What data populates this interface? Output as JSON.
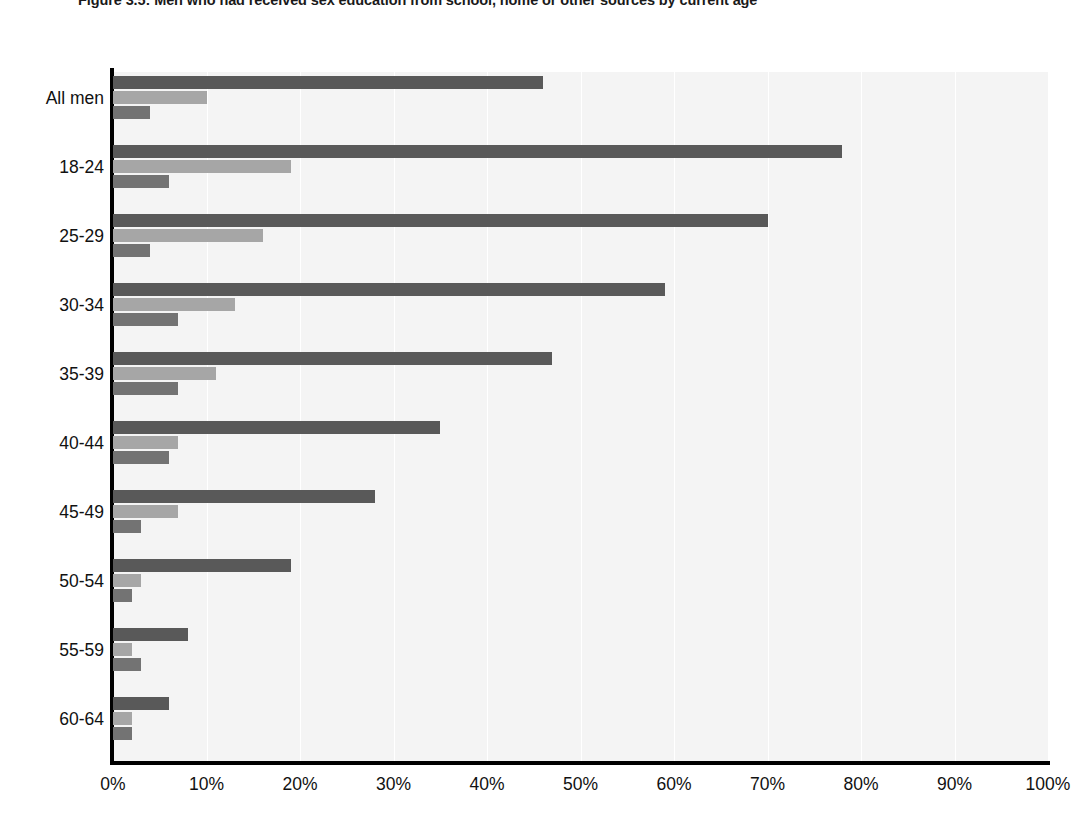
{
  "figure": {
    "title": "Figure 3.5: Men who had received sex education from school, home or other sources by current age"
  },
  "chart_data": {
    "type": "bar",
    "orientation": "horizontal",
    "title": "Figure 3.5: Men who had received sex education from school, home or other sources by current age",
    "xlabel": "",
    "ylabel": "",
    "xlim": [
      0,
      100
    ],
    "xunit": "%",
    "grid": true,
    "legend_position": "none",
    "categories": [
      "All men",
      "18-24",
      "25-29",
      "30-34",
      "35-39",
      "40-44",
      "45-49",
      "50-54",
      "55-59",
      "60-64"
    ],
    "xticks": [
      0,
      10,
      20,
      30,
      40,
      50,
      60,
      70,
      80,
      90,
      100
    ],
    "xticklabels": [
      "0%",
      "10%",
      "20%",
      "30%",
      "40%",
      "50%",
      "60%",
      "70%",
      "80%",
      "90%",
      "100%"
    ],
    "series": [
      {
        "name": "School",
        "color": "#595959",
        "values": [
          46,
          78,
          70,
          59,
          47,
          35,
          28,
          19,
          8,
          6
        ]
      },
      {
        "name": "Home",
        "color": "#a6a6a6",
        "values": [
          10,
          19,
          16,
          13,
          11,
          7,
          7,
          3,
          2,
          2
        ]
      },
      {
        "name": "Other sources",
        "color": "#737373",
        "values": [
          4,
          6,
          4,
          7,
          7,
          6,
          3,
          2,
          3,
          2
        ]
      }
    ]
  }
}
